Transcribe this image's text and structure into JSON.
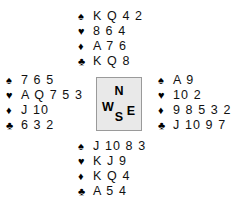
{
  "diagram": {
    "type": "bridge-deal",
    "suit_glyphs": {
      "spade": "♠",
      "heart": "♥",
      "diamond": "♦",
      "club": "♣"
    },
    "compass": {
      "north": "N",
      "west": "W",
      "east": "E",
      "south": "S",
      "fill_color": "#e9e9e9",
      "border_color": "#9a9a9a"
    },
    "hands": {
      "north": {
        "spades": "K Q 4 2",
        "hearts": "8 6 4",
        "diamonds": "A 7 6",
        "clubs": "K Q 8"
      },
      "west": {
        "spades": "7 6 5",
        "hearts": "A Q 7 5 3",
        "diamonds": "J 10",
        "clubs": "6 3 2"
      },
      "east": {
        "spades": "A 9",
        "hearts": "10 2",
        "diamonds": "9 8 5 3 2",
        "clubs": "J 10 9 7"
      },
      "south": {
        "spades": "J 10 8 3",
        "hearts": "K J 9",
        "diamonds": "K Q 4",
        "clubs": "A 5 4"
      }
    }
  }
}
